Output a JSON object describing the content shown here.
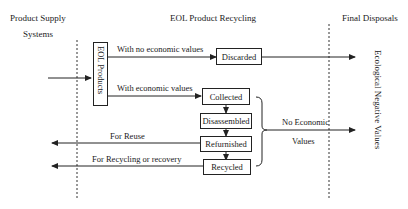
{
  "headers": {
    "left_line1": "Product Supply",
    "left_line2": "Systems",
    "middle": "EOL Product Recycling",
    "right": "Final Disposals"
  },
  "nodes": {
    "eol_products": "EOL Products",
    "discarded": "Discarded",
    "collected": "Collected",
    "disassembled": "Disassembled",
    "refurnished": "Refurnished",
    "recycled": "Recycled"
  },
  "edge_labels": {
    "no_economic_values": "With no economic values",
    "economic_values": "With economic values",
    "for_reuse": "For Reuse",
    "for_recycling": "For Recycling or recovery",
    "no_economic_line1": "No Economic",
    "no_economic_line2": "Values"
  },
  "side_label": "Ecological Negative Values",
  "colors": {
    "line": "#222222",
    "background": "#ffffff"
  }
}
